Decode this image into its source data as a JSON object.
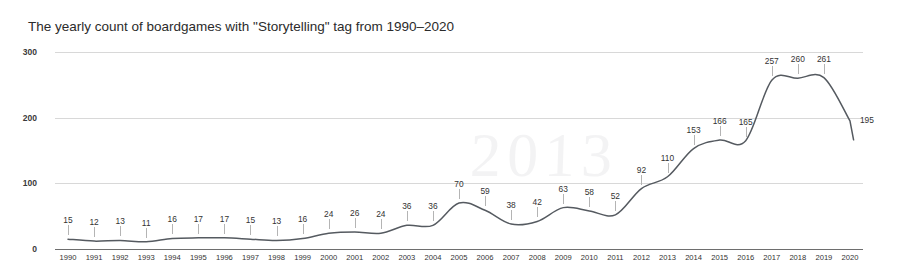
{
  "chart_data": {
    "type": "line",
    "title": "The yearly count of boardgames with \"Storytelling\" tag from 1990–2020",
    "xlabel": "",
    "ylabel": "",
    "ylim": [
      0,
      300
    ],
    "yticks": [
      0,
      100,
      200,
      300
    ],
    "grid": true,
    "legend": null,
    "smoothing": "spline",
    "categories": [
      "1990",
      "1991",
      "1992",
      "1993",
      "1994",
      "1995",
      "1996",
      "1997",
      "1998",
      "1999",
      "2000",
      "2001",
      "2002",
      "2003",
      "2004",
      "2005",
      "2006",
      "2007",
      "2008",
      "2009",
      "2010",
      "2011",
      "2012",
      "2013",
      "2014",
      "2015",
      "2016",
      "2017",
      "2018",
      "2019",
      "2020"
    ],
    "values": [
      15,
      12,
      13,
      11,
      16,
      17,
      17,
      15,
      13,
      16,
      24,
      26,
      24,
      36,
      36,
      70,
      59,
      38,
      42,
      63,
      58,
      52,
      92,
      110,
      153,
      166,
      165,
      257,
      260,
      261,
      195
    ],
    "data_labels": [
      "15",
      "12",
      "13",
      "11",
      "16",
      "17",
      "17",
      "15",
      "13",
      "16",
      "24",
      "26",
      "24",
      "36",
      "36",
      "70",
      "59",
      "38",
      "42",
      "63",
      "58",
      "52",
      "92",
      "110",
      "153",
      "166",
      "165",
      "257",
      "260",
      "261",
      "195"
    ],
    "line_color": "#555a60",
    "grid_color": "#d8d8d8",
    "axis_color": "#6e6e6e",
    "text_color": "#333333"
  },
  "watermark": {
    "text_main": "2013",
    "text_secondary": ""
  }
}
